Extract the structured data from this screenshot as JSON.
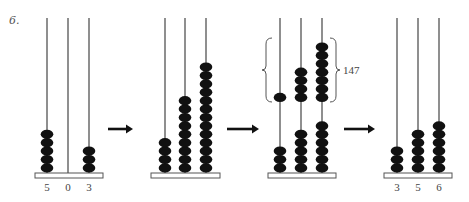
{
  "problem": {
    "number": "6."
  },
  "colors": {
    "bead": "#111111",
    "rod": "#333333",
    "base_fill": "#ffffff",
    "base_stroke": "#555555",
    "arrow": "#111111"
  },
  "abaci": [
    {
      "id": "start",
      "beads": [
        5,
        0,
        3
      ],
      "labels": [
        "5",
        "0",
        "3"
      ]
    },
    {
      "id": "step2",
      "beads": [
        4,
        9,
        13
      ],
      "labels": []
    },
    {
      "id": "step3",
      "beads_lower": [
        3,
        5,
        6
      ],
      "beads_upper": [
        1,
        4,
        7
      ],
      "bracket_label": "147"
    },
    {
      "id": "result",
      "beads": [
        3,
        5,
        6
      ],
      "labels": [
        "3",
        "5",
        "6"
      ]
    }
  ],
  "arrows": [
    "arrow-1",
    "arrow-2",
    "arrow-3"
  ]
}
